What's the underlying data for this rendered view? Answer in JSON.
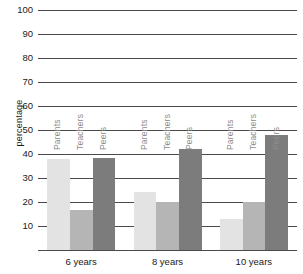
{
  "chart_data": {
    "type": "bar",
    "title": "",
    "xlabel": "",
    "ylabel": "percentage",
    "ylim": [
      0,
      100
    ],
    "yticks": [
      100,
      90,
      80,
      70,
      60,
      50,
      40,
      30,
      20,
      10
    ],
    "grid": true,
    "legend": "none",
    "series_labels_inline": true,
    "categories": [
      "6 years",
      "8 years",
      "10 years"
    ],
    "series": [
      {
        "name": "Parents",
        "color": "#e3e3e3",
        "values": [
          38,
          24,
          13
        ]
      },
      {
        "name": "Teachers",
        "color": "#b5b5b5",
        "values": [
          16.5,
          20,
          20
        ]
      },
      {
        "name": "Peers",
        "color": "#7c7c7c",
        "values": [
          38.5,
          42,
          48
        ]
      }
    ]
  },
  "axis": {
    "ylabel": "percentage",
    "ticks": [
      "100",
      "90",
      "80",
      "70",
      "60",
      "50",
      "40",
      "30",
      "20",
      "10"
    ]
  },
  "categories": [
    {
      "label": "6 years"
    },
    {
      "label": "8 years"
    },
    {
      "label": "10 years"
    }
  ],
  "series": [
    {
      "label": "Parents"
    },
    {
      "label": "Teachers"
    },
    {
      "label": "Peers"
    }
  ],
  "colors": {
    "parents": "#e3e3e3",
    "teachers": "#b5b5b5",
    "peers": "#7c7c7c",
    "axis": "#4a4a4a",
    "series_label": "#8c8c8c",
    "background": "#ffffff"
  }
}
